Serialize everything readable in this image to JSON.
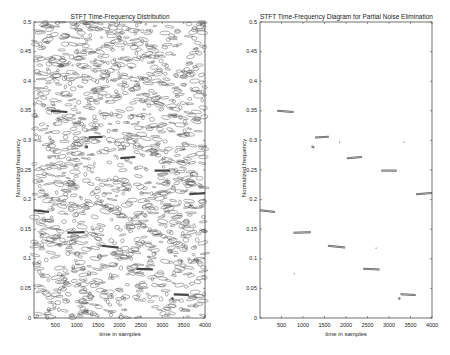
{
  "chart_data": [
    {
      "type": "heatmap",
      "subtype": "contour",
      "title": "STFT Time-Frequency Distribution",
      "xlabel": "time in samples",
      "ylabel": "Normalized frequency",
      "xlim": [
        0,
        4000
      ],
      "ylim": [
        0,
        0.5
      ],
      "xticks": [
        500,
        1000,
        1500,
        2000,
        2500,
        3000,
        3500,
        4000
      ],
      "yticks": [
        0,
        0.05,
        0.1,
        0.15,
        0.2,
        0.25,
        0.3,
        0.35,
        0.4,
        0.45,
        0.5
      ],
      "grid": false,
      "description": "Dense noisy contour map across entire time-frequency plane with embedded stronger components near 0.35, 0.3, 0.27, 0.25, 0.21, 0.18, 0.14, 0.12, 0.08, 0.04"
    },
    {
      "type": "scatter",
      "subtype": "contour-segments",
      "title": "STFT Time-Frequency Diagram for Partial Noise Elimination",
      "xlabel": "time in samples",
      "ylabel": "Normalized frequency",
      "xlim": [
        0,
        4000
      ],
      "ylim": [
        0,
        0.5
      ],
      "xticks": [
        500,
        1000,
        1500,
        2000,
        2500,
        3000,
        3500,
        4000
      ],
      "yticks": [
        0,
        0.05,
        0.1,
        0.15,
        0.2,
        0.25,
        0.3,
        0.35,
        0.4,
        0.45,
        0.5
      ],
      "grid": false,
      "segments": [
        {
          "t_start": 0,
          "t_end": 350,
          "freq_start": 0.182,
          "freq_end": 0.179
        },
        {
          "t_start": 400,
          "t_end": 780,
          "freq_start": 0.35,
          "freq_end": 0.348
        },
        {
          "t_start": 780,
          "t_end": 1180,
          "freq_start": 0.144,
          "freq_end": 0.145
        },
        {
          "t_start": 1200,
          "t_end": 1260,
          "freq_start": 0.29,
          "freq_end": 0.288
        },
        {
          "t_start": 1280,
          "t_end": 1600,
          "freq_start": 0.305,
          "freq_end": 0.306
        },
        {
          "t_start": 1580,
          "t_end": 1980,
          "freq_start": 0.122,
          "freq_end": 0.119
        },
        {
          "t_start": 2020,
          "t_end": 2370,
          "freq_start": 0.27,
          "freq_end": 0.272
        },
        {
          "t_start": 2400,
          "t_end": 2780,
          "freq_start": 0.083,
          "freq_end": 0.082
        },
        {
          "t_start": 2820,
          "t_end": 3180,
          "freq_start": 0.249,
          "freq_end": 0.249
        },
        {
          "t_start": 3220,
          "t_end": 3260,
          "freq_start": 0.034,
          "freq_end": 0.032
        },
        {
          "t_start": 3270,
          "t_end": 3620,
          "freq_start": 0.04,
          "freq_end": 0.039
        },
        {
          "t_start": 3630,
          "t_end": 4000,
          "freq_start": 0.209,
          "freq_end": 0.211
        }
      ]
    }
  ],
  "plots": [
    {
      "title": "STFT Time-Frequency Distribution",
      "xlabel": "time in samples",
      "ylabel": "Normalized frequency"
    },
    {
      "title": "STFT Time-Frequency Diagram for Partial Noise Elimination",
      "xlabel": "time in samples",
      "ylabel": "Normalized frequency"
    }
  ],
  "xtick_labels": [
    "500",
    "1000",
    "1500",
    "2000",
    "2500",
    "3000",
    "3500",
    "4000"
  ],
  "ytick_labels": [
    "0",
    "0.05",
    "0.1",
    "0.15",
    "0.2",
    "0.25",
    "0.3",
    "0.35",
    "0.4",
    "0.45",
    "0.5"
  ]
}
